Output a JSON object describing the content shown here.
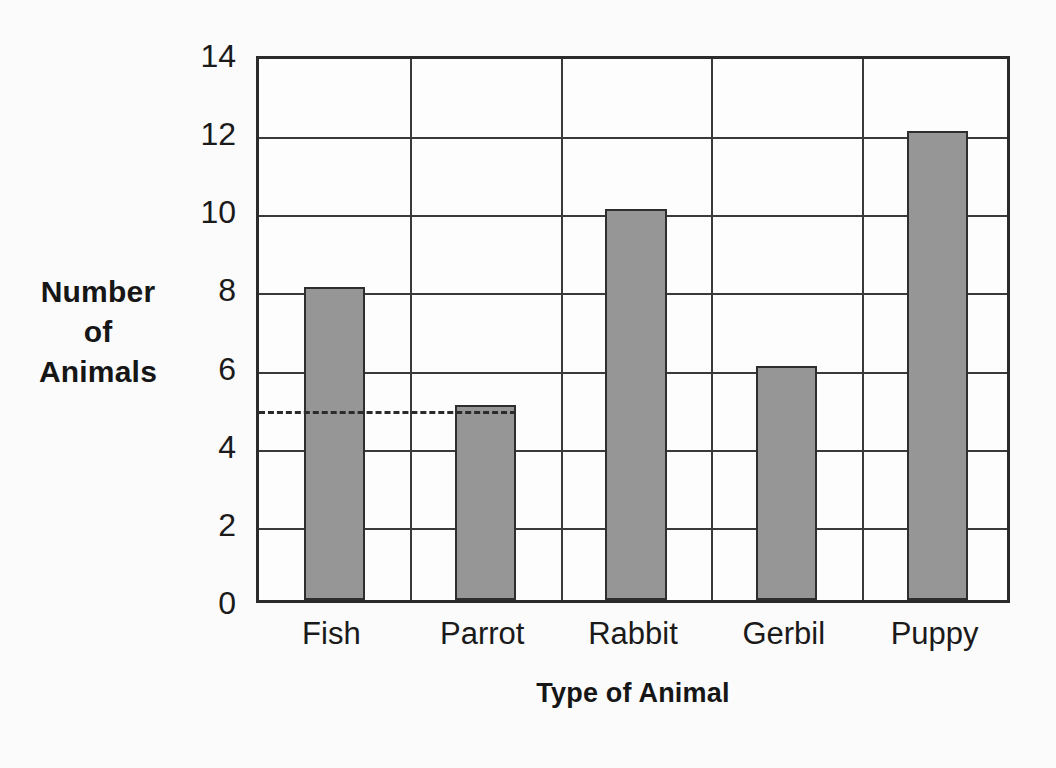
{
  "chart_data": {
    "type": "bar",
    "title": "",
    "xlabel": "Type of Animal",
    "ylabel": "Number of Animals",
    "ylabel_lines": [
      "Number",
      "of",
      "Animals"
    ],
    "categories": [
      "Fish",
      "Parrot",
      "Rabbit",
      "Gerbil",
      "Puppy"
    ],
    "values": [
      8,
      5,
      10,
      6,
      12
    ],
    "series": [
      {
        "name": "Number of Animals",
        "values": [
          8,
          5,
          10,
          6,
          12
        ]
      }
    ],
    "ylim": [
      0,
      14
    ],
    "y_major_ticks": [
      0,
      2,
      4,
      6,
      8,
      10,
      12,
      14
    ],
    "y_major_tick_labels": [
      "0",
      "2",
      "4",
      "6",
      "8",
      "10",
      "12",
      "14"
    ],
    "y_minor_ticks": [
      1,
      3,
      5,
      7,
      9,
      11,
      13
    ],
    "y_tick_interval": 2,
    "grid": "horizontal-major-and-vertical-category",
    "legend": "none",
    "annotations": [
      {
        "type": "dashed-reference-line",
        "orientation": "horizontal",
        "value": 5,
        "label": "",
        "spans_from_category": "Fish",
        "spans_to_category": "Parrot"
      }
    ],
    "colors": {
      "bar_fill": "#969696",
      "bar_stroke": "#2e2e2e",
      "grid": "#3a3a3a",
      "axis": "#2b2b2b",
      "background": "#fbfbfb",
      "plot_background": "#fdfdfd",
      "text": "#1a1a1a"
    }
  }
}
